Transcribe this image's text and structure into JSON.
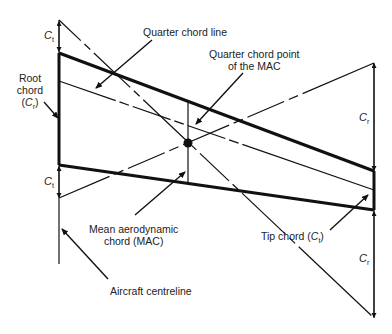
{
  "diagram": {
    "labels": {
      "quarter_chord_line": "Quarter chord line",
      "quarter_chord_point_line1": "Quarter chord point",
      "quarter_chord_point_line2": "of the MAC",
      "root_chord_line1": "Root",
      "root_chord_line2": "chord",
      "root_chord_line3_open": "(",
      "root_chord_line3_close": ")",
      "mac_line1": "Mean aerodynamic",
      "mac_line2": "chord (MAC)",
      "tip_chord": "Tip chord (",
      "tip_chord_close": ")",
      "aircraft_centreline": "Aircraft centreline"
    },
    "symbols": {
      "c_letter": "C",
      "tip_sub": "t",
      "root_sub": "r"
    },
    "dimension_marks": [
      {
        "name": "Ct-above-root",
        "symbol": "Ct"
      },
      {
        "name": "Ct-below-root",
        "symbol": "Ct"
      },
      {
        "name": "Cr-above-tip",
        "symbol": "Cr"
      },
      {
        "name": "Cr-below-tip",
        "symbol": "Cr"
      }
    ],
    "colors": {
      "ink": "#111111",
      "background": "#ffffff"
    }
  }
}
